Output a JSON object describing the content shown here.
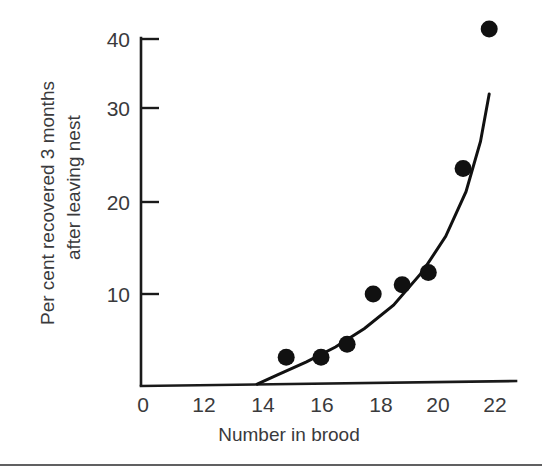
{
  "chart_data": {
    "type": "scatter",
    "title": "",
    "xlabel": "Number in brood",
    "ylabel": "Per cent recovered 3 months after leaving nest",
    "ylabel_lines": [
      "Per cent recovered 3 months",
      "after leaving nest"
    ],
    "x": [
      14.8,
      16.0,
      16.9,
      17.8,
      18.8,
      19.7,
      20.9,
      21.8
    ],
    "y": [
      3.2,
      3.2,
      4.6,
      10.0,
      11.0,
      12.3,
      23.5,
      38.5
    ],
    "points": [
      {
        "x": 14.8,
        "y": 3.2
      },
      {
        "x": 16.0,
        "y": 3.2
      },
      {
        "x": 16.9,
        "y": 4.6
      },
      {
        "x": 17.8,
        "y": 10.0
      },
      {
        "x": 18.8,
        "y": 11.0
      },
      {
        "x": 19.7,
        "y": 12.3
      },
      {
        "x": 20.9,
        "y": 23.5
      },
      {
        "x": 21.8,
        "y": 38.5
      }
    ],
    "series": [
      {
        "name": "fitted curve",
        "type": "line",
        "x": [
          13.8,
          14.5,
          15.5,
          16.5,
          17.5,
          18.5,
          19.5,
          20.3,
          21.0,
          21.5,
          21.8
        ],
        "y": [
          0.3,
          1.3,
          2.7,
          4.3,
          6.3,
          8.8,
          12.4,
          16.2,
          21.0,
          26.4,
          31.5
        ]
      }
    ],
    "xticks": [
      0,
      12,
      14,
      16,
      18,
      20,
      22
    ],
    "xtick_labels": [
      "0",
      "12",
      "14",
      "16",
      "18",
      "20",
      "22"
    ],
    "yticks": [
      10,
      20,
      30,
      40
    ],
    "ytick_labels": [
      "10",
      "20",
      "30",
      "40"
    ],
    "xlim": [
      13,
      22.6
    ],
    "ylim": [
      0,
      40
    ],
    "grid": false,
    "legend": false,
    "marker": "filled-circle",
    "marker_color": "#111111",
    "line_color": "#111111",
    "axis_color": "#1a1a1a",
    "background": "#ffffff",
    "note": "x axis is broken: 0 label sits at the axis origin, then the scale resumes at 12"
  },
  "axes": {
    "y_tick_direction": "inward-right",
    "x_tick_direction": "none"
  }
}
